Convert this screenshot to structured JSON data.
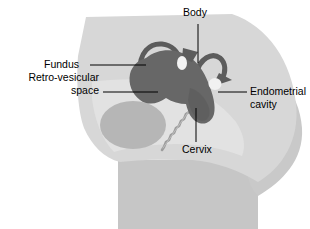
{
  "figure": {
    "background_color": "#ffffff"
  },
  "colors": {
    "body_light": "#d6d6d6",
    "body_mid": "#c4c4c4",
    "abdomen_pale": "#dcdcdc",
    "bladder": "#b4b4b4",
    "uterus": "#666666",
    "tube": "#5e5e5e",
    "ovary": "#f2f2f2",
    "vagina": "#9a9a9a",
    "outline": "#8c8c8c",
    "leader_line": "#000000",
    "text": "#000000"
  },
  "labels": [
    {
      "id": "body",
      "text": "Body",
      "x": 183,
      "y": 10,
      "align": "left",
      "leader": {
        "x1": 198,
        "y1": 24,
        "x2": 198,
        "y2": 63
      }
    },
    {
      "id": "fundus",
      "text": "Fundus",
      "x": 44,
      "y": 59,
      "align": "left",
      "leader": {
        "x1": 90,
        "y1": 65,
        "x2": 146,
        "y2": 65
      }
    },
    {
      "id": "retro-vesicular-space",
      "text": "Retro-vesicular",
      "text_line2": "space",
      "x": 15,
      "y": 72,
      "align": "left",
      "leader": {
        "x1": 103,
        "y1": 92,
        "x2": 158,
        "y2": 92
      }
    },
    {
      "id": "endometrial-cavity",
      "text": "Endometrial",
      "text_line2": "cavity",
      "x": 252,
      "y": 86,
      "align": "left",
      "leader": {
        "x1": 218,
        "y1": 92,
        "x2": 247,
        "y2": 92
      }
    },
    {
      "id": "cervix",
      "text": "Cervix",
      "x": 182,
      "y": 144,
      "align": "left",
      "leader": {
        "x1": 196,
        "y1": 108,
        "x2": 196,
        "y2": 142
      }
    }
  ],
  "structures": [
    {
      "id": "abdomen-silhouette",
      "name": "Abdomen and pelvis silhouette"
    },
    {
      "id": "buttock",
      "name": "Buttock and thigh"
    },
    {
      "id": "pelvic-cavity",
      "name": "Pelvic cavity"
    },
    {
      "id": "bladder",
      "name": "Bladder"
    },
    {
      "id": "uterus-body",
      "name": "Uterus body and fundus"
    },
    {
      "id": "endometrial-cavity-region",
      "name": "Endometrial cavity"
    },
    {
      "id": "left-fallopian-tube",
      "name": "Left fallopian tube"
    },
    {
      "id": "right-fallopian-tube",
      "name": "Right fallopian tube"
    },
    {
      "id": "left-ovary",
      "name": "Left ovary"
    },
    {
      "id": "right-ovary",
      "name": "Right ovary"
    },
    {
      "id": "cervix-canal",
      "name": "Cervix and vaginal canal"
    }
  ]
}
